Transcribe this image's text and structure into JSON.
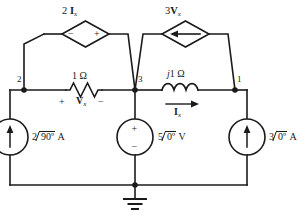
{
  "figure": {
    "type": "circuit-schematic",
    "line_color": "#1a1a1a",
    "background": "#ffffff"
  },
  "nodes": [
    {
      "id": "node-1",
      "label": "1",
      "x": 235,
      "y": 90
    },
    {
      "id": "node-2",
      "label": "2",
      "x": 24,
      "y": 90
    },
    {
      "id": "node-3",
      "label": "3",
      "x": 135,
      "y": 90
    }
  ],
  "components": {
    "dependent_voltage_source": {
      "name": "2 Ix dependent source",
      "gain": "2",
      "control_var": "I",
      "control_sub": "x",
      "polarity_left": "−",
      "polarity_right": "+"
    },
    "dependent_current_source": {
      "name": "3 Vx dependent source",
      "gain": "3",
      "control_var": "V",
      "control_sub": "x",
      "arrow_direction": "left"
    },
    "resistor": {
      "value": "1 Ω",
      "polarity_plus": "+",
      "polarity_minus": "−",
      "voltage_var": "V",
      "voltage_sub": "x"
    },
    "inductor": {
      "value_prefix": "j",
      "value": "1 Ω",
      "current_var": "I",
      "current_sub": "x",
      "arrow_direction": "right"
    },
    "current_source_left": {
      "magnitude": "2",
      "angle": "90º",
      "unit": "A",
      "arrow_direction": "up"
    },
    "voltage_source_mid": {
      "magnitude": "5",
      "angle": "0º",
      "unit": "V",
      "polarity_top": "+",
      "polarity_bottom": "−"
    },
    "current_source_right": {
      "magnitude": "3",
      "angle": "0º",
      "unit": "A",
      "arrow_direction": "up"
    },
    "ground": {
      "label": "ground",
      "bars": 3
    }
  }
}
